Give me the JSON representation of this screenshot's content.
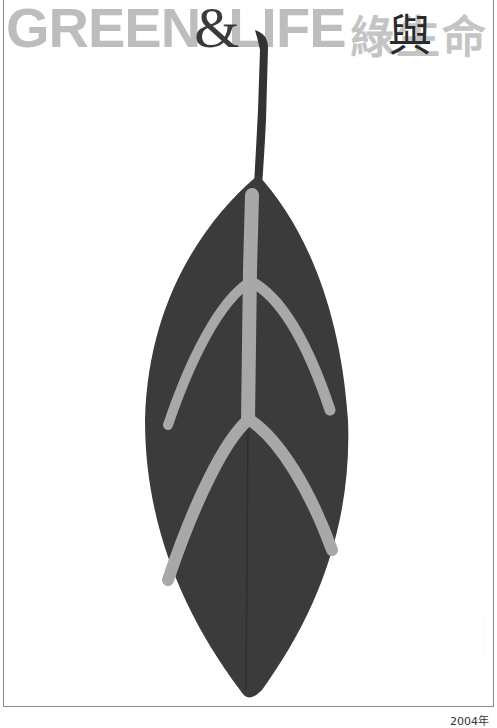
{
  "poster": {
    "title_en_left": "GREEN",
    "title_en_amp": "&",
    "title_en_right": "LIFE",
    "title_zh": "綠生命",
    "title_zh_overlay": "與",
    "side_note": "··· ······ ·······",
    "year": "2004年"
  },
  "colors": {
    "title_gray": "#bdbdbd",
    "leaf_dark": "#3b3b3b",
    "vein_light": "#a8a8a8",
    "frame": "#8a8a8a"
  },
  "image": {
    "subject": "leaf-with-light-veins"
  }
}
